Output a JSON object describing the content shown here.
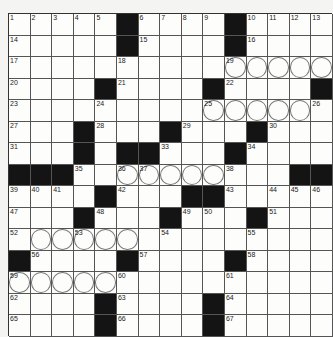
{
  "puzzle": {
    "rows": 15,
    "cols": 15,
    "layout": [
      "#####B#####B####",
      "placeholder"
    ],
    "grid": [
      ".....#....#....",
      ".....#....#....",
      "...............",
      "....#....#....#",
      "...............",
      "...#...#...#...",
      "...#.##...#....",
      "###..........##",
      "....#...##.....",
      "...#...#...#...",
      "...............",
      "#....#....#....",
      "...............",
      "....#....#.....",
      "....#....#....."
    ],
    "numbers": [
      {
        "r": 0,
        "c": 0,
        "n": "1"
      },
      {
        "r": 0,
        "c": 1,
        "n": "2"
      },
      {
        "r": 0,
        "c": 2,
        "n": "3"
      },
      {
        "r": 0,
        "c": 3,
        "n": "4"
      },
      {
        "r": 0,
        "c": 4,
        "n": "5"
      },
      {
        "r": 0,
        "c": 6,
        "n": "6"
      },
      {
        "r": 0,
        "c": 7,
        "n": "7"
      },
      {
        "r": 0,
        "c": 8,
        "n": "8"
      },
      {
        "r": 0,
        "c": 9,
        "n": "9"
      },
      {
        "r": 0,
        "c": 11,
        "n": "10"
      },
      {
        "r": 0,
        "c": 12,
        "n": "11"
      },
      {
        "r": 0,
        "c": 13,
        "n": "12"
      },
      {
        "r": 0,
        "c": 14,
        "n": "13"
      },
      {
        "r": 1,
        "c": 0,
        "n": "14"
      },
      {
        "r": 1,
        "c": 6,
        "n": "15"
      },
      {
        "r": 1,
        "c": 11,
        "n": "16"
      },
      {
        "r": 2,
        "c": 0,
        "n": "17"
      },
      {
        "r": 2,
        "c": 5,
        "n": "18"
      },
      {
        "r": 2,
        "c": 10,
        "n": "19"
      },
      {
        "r": 3,
        "c": 0,
        "n": "20"
      },
      {
        "r": 3,
        "c": 5,
        "n": "21"
      },
      {
        "r": 3,
        "c": 10,
        "n": "22"
      },
      {
        "r": 4,
        "c": 0,
        "n": "23"
      },
      {
        "r": 4,
        "c": 4,
        "n": "24"
      },
      {
        "r": 4,
        "c": 9,
        "n": "25"
      },
      {
        "r": 4,
        "c": 14,
        "n": "26"
      },
      {
        "r": 5,
        "c": 0,
        "n": "27"
      },
      {
        "r": 5,
        "c": 4,
        "n": "28"
      },
      {
        "r": 5,
        "c": 8,
        "n": "29"
      },
      {
        "r": 5,
        "c": 12,
        "n": "30"
      },
      {
        "r": 6,
        "c": 0,
        "n": "31"
      },
      {
        "r": 6,
        "c": 3,
        "n": "32"
      },
      {
        "r": 6,
        "c": 7,
        "n": "33"
      },
      {
        "r": 6,
        "c": 11,
        "n": "34"
      },
      {
        "r": 7,
        "c": 3,
        "n": "35"
      },
      {
        "r": 7,
        "c": 5,
        "n": "36"
      },
      {
        "r": 7,
        "c": 6,
        "n": "37"
      },
      {
        "r": 7,
        "c": 10,
        "n": "38"
      },
      {
        "r": 8,
        "c": 0,
        "n": "39"
      },
      {
        "r": 8,
        "c": 1,
        "n": "40"
      },
      {
        "r": 8,
        "c": 2,
        "n": "41"
      },
      {
        "r": 8,
        "c": 5,
        "n": "42"
      },
      {
        "r": 8,
        "c": 10,
        "n": "43"
      },
      {
        "r": 8,
        "c": 12,
        "n": "44"
      },
      {
        "r": 8,
        "c": 13,
        "n": "45"
      },
      {
        "r": 8,
        "c": 14,
        "n": "46"
      },
      {
        "r": 9,
        "c": 0,
        "n": "47"
      },
      {
        "r": 9,
        "c": 4,
        "n": "48"
      },
      {
        "r": 9,
        "c": 8,
        "n": "49"
      },
      {
        "r": 9,
        "c": 9,
        "n": "50"
      },
      {
        "r": 9,
        "c": 12,
        "n": "51"
      },
      {
        "r": 10,
        "c": 0,
        "n": "52"
      },
      {
        "r": 10,
        "c": 3,
        "n": "53"
      },
      {
        "r": 10,
        "c": 7,
        "n": "54"
      },
      {
        "r": 10,
        "c": 11,
        "n": "55"
      },
      {
        "r": 11,
        "c": 1,
        "n": "56"
      },
      {
        "r": 11,
        "c": 6,
        "n": "57"
      },
      {
        "r": 11,
        "c": 11,
        "n": "58"
      },
      {
        "r": 12,
        "c": 0,
        "n": "59"
      },
      {
        "r": 12,
        "c": 5,
        "n": "60"
      },
      {
        "r": 12,
        "c": 10,
        "n": "61"
      },
      {
        "r": 13,
        "c": 0,
        "n": "62"
      },
      {
        "r": 13,
        "c": 5,
        "n": "63"
      },
      {
        "r": 13,
        "c": 10,
        "n": "64"
      },
      {
        "r": 14,
        "c": 0,
        "n": "65"
      },
      {
        "r": 14,
        "c": 5,
        "n": "66"
      },
      {
        "r": 14,
        "c": 10,
        "n": "67"
      }
    ],
    "circles": [
      [
        2,
        10
      ],
      [
        2,
        11
      ],
      [
        2,
        12
      ],
      [
        2,
        13
      ],
      [
        2,
        14
      ],
      [
        4,
        9
      ],
      [
        4,
        10
      ],
      [
        4,
        11
      ],
      [
        4,
        12
      ],
      [
        4,
        13
      ],
      [
        7,
        5
      ],
      [
        7,
        6
      ],
      [
        7,
        7
      ],
      [
        7,
        8
      ],
      [
        7,
        9
      ],
      [
        10,
        1
      ],
      [
        10,
        2
      ],
      [
        10,
        3
      ],
      [
        10,
        4
      ],
      [
        10,
        5
      ],
      [
        12,
        0
      ],
      [
        12,
        1
      ],
      [
        12,
        2
      ],
      [
        12,
        3
      ],
      [
        12,
        4
      ]
    ]
  },
  "colors": {
    "black_square": "#141414",
    "white_square": "#fdfdfb",
    "grid_line": "#555555"
  }
}
